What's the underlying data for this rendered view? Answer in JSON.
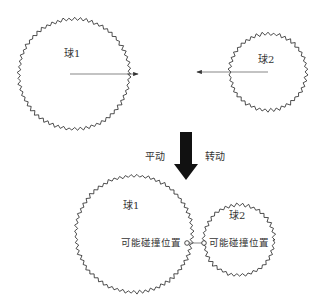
{
  "diagram": {
    "top": {
      "ball1": {
        "label": "球1",
        "cx": 74,
        "cy": 74,
        "r": 55
      },
      "ball2": {
        "label": "球2",
        "cx": 268,
        "cy": 72,
        "r": 38
      },
      "arrow1": {
        "x1": 70,
        "y1": 74,
        "x2": 140,
        "y2": 74
      },
      "arrow2": {
        "x1": 268,
        "y1": 72,
        "x2": 195,
        "y2": 72
      }
    },
    "transition": {
      "left_label": "平动",
      "right_label": "转动"
    },
    "bottom": {
      "ball1": {
        "label": "球1",
        "cx": 134,
        "cy": 234,
        "r": 58,
        "contact_label": "可能碰撞位置"
      },
      "ball2": {
        "label": "球2",
        "cx": 239,
        "cy": 240,
        "r": 35,
        "contact_label": "可能碰撞位置"
      }
    },
    "colors": {
      "stroke": "#222222",
      "arrow": "#555555",
      "big_arrow": "#111111"
    }
  }
}
